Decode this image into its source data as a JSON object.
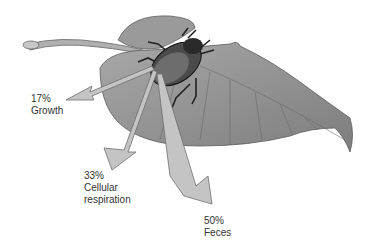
{
  "diagram": {
    "colors": {
      "arrow_fill": "#c4c4c4",
      "arrow_stroke": "#6e6e6e",
      "leaf": "#8f8f8f",
      "beetle": "#3a3a3a",
      "text": "#333333"
    },
    "outputs": [
      {
        "percent": "17%",
        "label": "Growth"
      },
      {
        "percent": "33%",
        "label_line1": "Cellular",
        "label_line2": "respiration"
      },
      {
        "percent": "50%",
        "label": "Feces"
      }
    ]
  }
}
